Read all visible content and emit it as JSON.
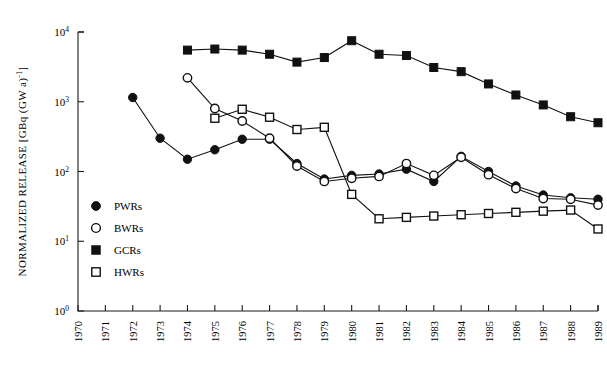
{
  "chart_data": {
    "type": "line",
    "title": "",
    "xlabel": "",
    "ylabel": "NORMALIZED RELEASE [GBq (GW a)",
    "ylabel_sup": "-1",
    "ylabel_tail": "]",
    "x": [
      1970,
      1971,
      1972,
      1973,
      1974,
      1975,
      1976,
      1977,
      1978,
      1979,
      1980,
      1981,
      1982,
      1983,
      1984,
      1985,
      1986,
      1987,
      1988,
      1989
    ],
    "xtick_labels": [
      "1970",
      "1971",
      "1972",
      "1973",
      "1974",
      "1975",
      "1976",
      "1977",
      "1978",
      "1979",
      "1980",
      "1981",
      "1982",
      "1983",
      "1984",
      "1985",
      "1986",
      "1987",
      "1988",
      "1989"
    ],
    "ytick_labels": [
      "10^0",
      "10^1",
      "10^2",
      "10^3",
      "10^4"
    ],
    "ytick_mantissa": [
      "10",
      "10",
      "10",
      "10",
      "10"
    ],
    "ytick_exponent": [
      "0",
      "1",
      "2",
      "3",
      "4"
    ],
    "ylim": [
      1,
      10000
    ],
    "xlim": [
      1970,
      1989
    ],
    "yscale": "log",
    "grid": false,
    "legend_position": "lower-left-inside",
    "series": [
      {
        "name": "PWRs",
        "marker": "filled-circle",
        "x": [
          1972,
          1973,
          1974,
          1975,
          1976,
          1977,
          1978,
          1979,
          1980,
          1981,
          1982,
          1983,
          1984,
          1985,
          1986,
          1987,
          1988,
          1989
        ],
        "values": [
          1150,
          300,
          150,
          205,
          290,
          290,
          130,
          78,
          88,
          92,
          108,
          72,
          165,
          100,
          62,
          46,
          42,
          40
        ]
      },
      {
        "name": "BWRs",
        "marker": "open-circle",
        "x": [
          1974,
          1975,
          1976,
          1977,
          1978,
          1979,
          1980,
          1981,
          1982,
          1983,
          1984,
          1985,
          1986,
          1987,
          1988,
          1989
        ],
        "values": [
          2200,
          800,
          530,
          300,
          120,
          72,
          80,
          85,
          130,
          88,
          160,
          90,
          57,
          41,
          40,
          33
        ]
      },
      {
        "name": "GCRs",
        "marker": "filled-square",
        "x": [
          1974,
          1975,
          1976,
          1977,
          1978,
          1979,
          1980,
          1981,
          1982,
          1983,
          1984,
          1985,
          1986,
          1987,
          1988,
          1989
        ],
        "values": [
          5500,
          5700,
          5500,
          4800,
          3700,
          4300,
          7500,
          4800,
          4600,
          3100,
          2700,
          1800,
          1250,
          900,
          610,
          500
        ]
      },
      {
        "name": "HWRs",
        "marker": "open-square",
        "x": [
          1975,
          1976,
          1977,
          1978,
          1979,
          1980,
          1981,
          1982,
          1983,
          1984,
          1985,
          1986,
          1987,
          1988,
          1989
        ],
        "values": [
          580,
          780,
          600,
          400,
          430,
          47,
          21,
          22,
          23,
          24,
          25,
          26,
          27,
          28,
          15
        ]
      }
    ],
    "legend": [
      {
        "label": "PWRs",
        "marker": "filled-circle"
      },
      {
        "label": "BWRs",
        "marker": "open-circle"
      },
      {
        "label": "GCRs",
        "marker": "filled-square"
      },
      {
        "label": "HWRs",
        "marker": "open-square"
      }
    ],
    "colors": {
      "ink": "#111111",
      "background": "#ffffff"
    }
  }
}
